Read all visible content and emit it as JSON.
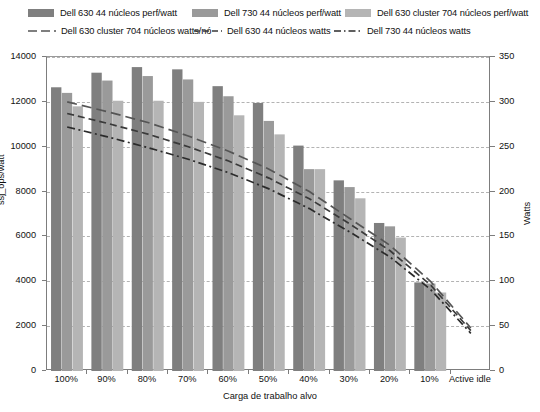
{
  "chart_data": {
    "type": "bar",
    "title": "",
    "xlabel": "Carga de trabalho alvo",
    "ylabel": "ssj_ops/watt",
    "ylabel_right": "Watts",
    "ylim": [
      0,
      14000
    ],
    "ylim_right": [
      0,
      350
    ],
    "yticks": [
      0,
      2000,
      4000,
      6000,
      8000,
      10000,
      12000,
      14000
    ],
    "yticks_right": [
      0,
      50,
      100,
      150,
      200,
      250,
      300,
      350
    ],
    "grid": true,
    "legend_position": "top",
    "categories": [
      "100%",
      "90%",
      "80%",
      "70%",
      "60%",
      "50%",
      "40%",
      "30%",
      "20%",
      "10%",
      "Active idle"
    ],
    "bar_series": [
      {
        "name": "Dell 630 44 núcleos perf/watt",
        "color": "#7f7f7f",
        "axis": "left",
        "values": [
          12650,
          13300,
          13550,
          13450,
          12700,
          11950,
          10050,
          8500,
          6600,
          3950,
          0
        ]
      },
      {
        "name": "Dell 730 44 núcleos perf/watt",
        "color": "#9a9a9a",
        "axis": "left",
        "values": [
          12400,
          12950,
          13150,
          13000,
          12250,
          11150,
          9000,
          8200,
          6450,
          3900,
          0
        ]
      },
      {
        "name": "Dell 630 cluster 704 núcleos perf/watt",
        "color": "#b5b5b5",
        "axis": "left",
        "values": [
          11800,
          12050,
          12050,
          12000,
          11400,
          10550,
          9000,
          7700,
          5950,
          3500,
          0
        ]
      }
    ],
    "line_series": [
      {
        "name": "Dell 630 cluster 704 núcleos watts/nó",
        "color": "#555555",
        "dash": "long-dash",
        "axis": "right",
        "values": [
          300,
          289,
          277,
          262,
          245,
          225,
          200,
          170,
          140,
          100,
          48
        ]
      },
      {
        "name": "Dell 630 44 núcleos watts",
        "color": "#3a3a3a",
        "dash": "dashed",
        "axis": "right",
        "values": [
          287,
          276,
          264,
          250,
          234,
          215,
          192,
          164,
          134,
          96,
          45
        ]
      },
      {
        "name": "Dell 730 44 núcleos watts",
        "color": "#2b2b2b",
        "dash": "dash-dot",
        "axis": "right",
        "values": [
          272,
          261,
          249,
          236,
          221,
          203,
          181,
          155,
          127,
          91,
          42
        ]
      }
    ]
  },
  "legend": {
    "row1": [
      {
        "label": "Dell 630 44 núcleos perf/watt",
        "color": "#7f7f7f",
        "type": "swatch"
      },
      {
        "label": "Dell 730 44 núcleos perf/watt",
        "color": "#9a9a9a",
        "type": "swatch"
      },
      {
        "label": "Dell 630 cluster 704 núcleos perf/watt",
        "color": "#b5b5b5",
        "type": "swatch"
      }
    ],
    "row2": [
      {
        "label": "Dell 630 cluster 704 núcleos watts/nó",
        "color": "#555555",
        "type": "long-dash"
      },
      {
        "label": "Dell 630 44 núcleos watts",
        "color": "#3a3a3a",
        "type": "dashed"
      },
      {
        "label": "Dell 730 44 núcleos watts",
        "color": "#2b2b2b",
        "type": "dash-dot"
      }
    ]
  },
  "axes": {
    "left_title": "ssj_ops/watt",
    "right_title": "Watts",
    "x_title": "Carga de trabalho alvo"
  }
}
